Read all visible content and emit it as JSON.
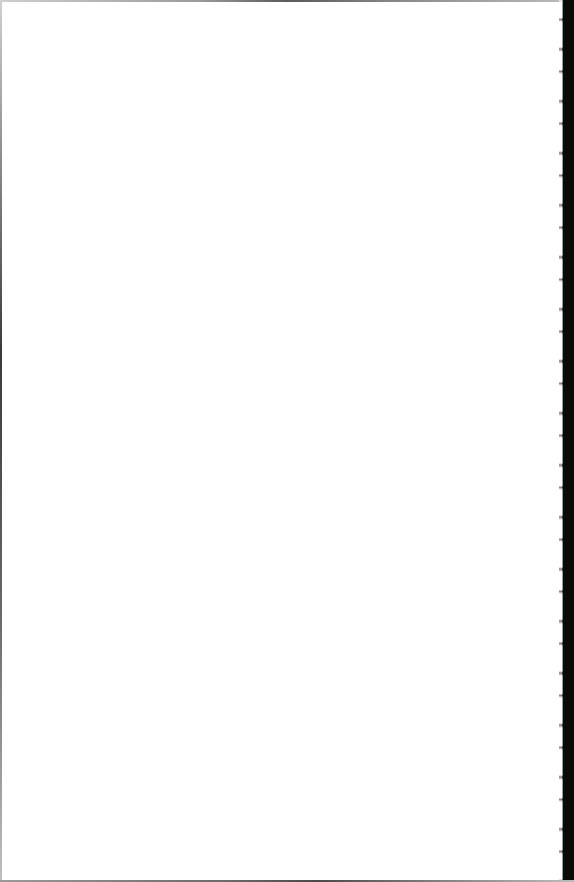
{
  "document": {
    "type": "scanned-page",
    "content": "",
    "background_color": "#ffffff",
    "edge_color": "#0a0a0a"
  }
}
